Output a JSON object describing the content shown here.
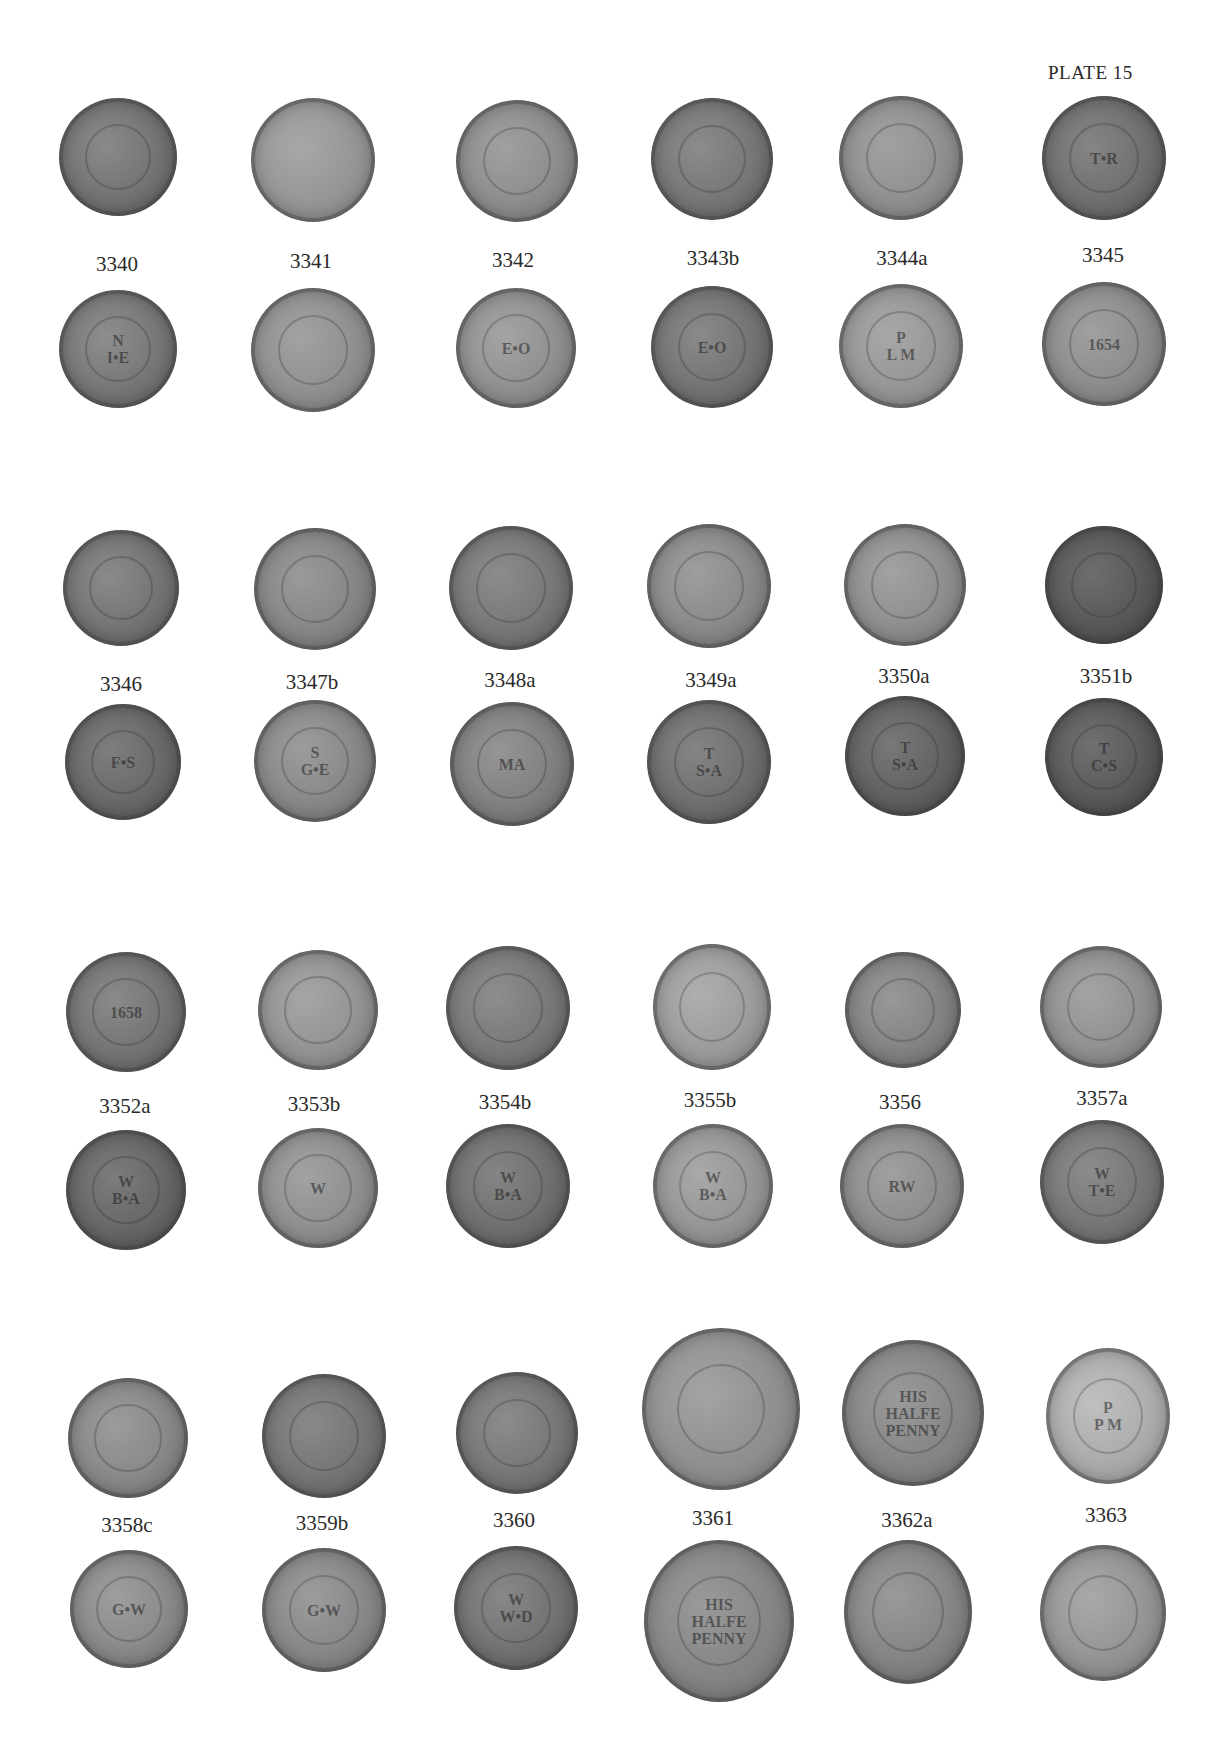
{
  "plate": {
    "title": "PLATE 15"
  },
  "colors": {
    "coin_dark": "#5e5e5e",
    "coin_mid": "#888888",
    "coin_light": "#a9a9a9",
    "background": "#ffffff"
  },
  "groups": [
    {
      "labels": [
        "3340",
        "3341",
        "3342",
        "3343b",
        "3344a",
        "3345"
      ],
      "obverse_center": [
        "",
        "",
        "",
        "",
        "",
        "T•R"
      ],
      "reverse_center": [
        "N\nI•E",
        "",
        "E•O",
        "E•O",
        "P\nL M",
        "1654"
      ]
    },
    {
      "labels": [
        "3346",
        "3347b",
        "3348a",
        "3349a",
        "3350a",
        "3351b"
      ],
      "obverse_center": [
        "",
        "",
        "",
        "",
        "",
        ""
      ],
      "reverse_center": [
        "F•S",
        "S\nG•E",
        "MA",
        "T\nS•A",
        "T\nS•A",
        "T\nC•S"
      ]
    },
    {
      "labels": [
        "3352a",
        "3353b",
        "3354b",
        "3355b",
        "3356",
        "3357a"
      ],
      "obverse_center": [
        "1658",
        "",
        "",
        "",
        "",
        ""
      ],
      "reverse_center": [
        "W\nB•A",
        "W",
        "W\nB•A",
        "W\nB•A",
        "RW",
        "W\nT•E"
      ]
    },
    {
      "labels": [
        "3358c",
        "3359b",
        "3360",
        "3361",
        "3362a",
        "3363"
      ],
      "obverse_center": [
        "",
        "",
        "",
        "",
        "HIS\nHALFE\nPENNY",
        "P\nP M"
      ],
      "reverse_center": [
        "G•W",
        "G•W",
        "W\nW•D",
        "HIS\nHALFE\nPENNY",
        "",
        ""
      ]
    }
  ]
}
